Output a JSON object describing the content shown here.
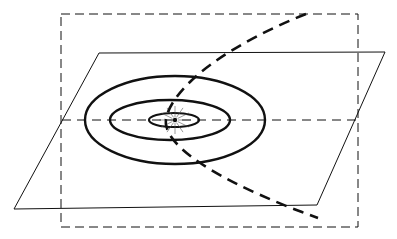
{
  "diagram": {
    "colors": {
      "background": "#ffffff",
      "ink": "#111111"
    },
    "vertical_plane": {
      "x": 61,
      "y": 14,
      "width": 297,
      "height": 213,
      "style": "dashed"
    },
    "horizontal_plane": {
      "points": "99,53 385,52 317,205 14,209",
      "style": "solid-thin"
    },
    "intersection_line": {
      "x1": 62,
      "y1": 120,
      "x2": 358,
      "y2": 120,
      "style": "dashed-thin"
    },
    "orbits": [
      {
        "name": "outer-orbit",
        "cx": 175,
        "cy": 120,
        "rx": 90,
        "ry": 44
      },
      {
        "name": "middle-orbit",
        "cx": 170,
        "cy": 120,
        "rx": 60,
        "ry": 20
      },
      {
        "name": "inner-orbit",
        "cx": 174,
        "cy": 120,
        "rx": 25,
        "ry": 7
      }
    ],
    "center_point": {
      "cx": 175,
      "cy": 120
    },
    "trajectory": {
      "path": "M306,14 C240,40 176,80 166,118 C160,150 240,190 318,218",
      "style": "dashed-bold"
    }
  }
}
